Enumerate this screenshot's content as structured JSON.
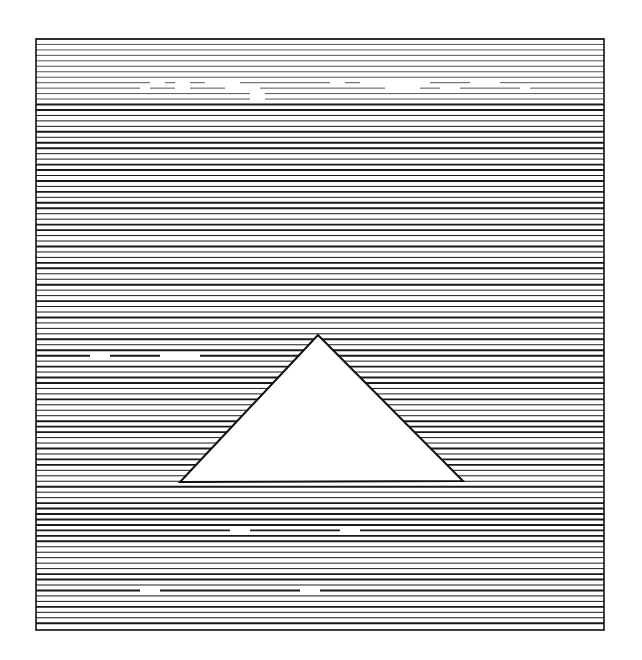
{
  "canvas": {
    "width": 642,
    "height": 660,
    "background": "#ffffff"
  },
  "figure": {
    "type": "horizontal-line-field-with-triangle",
    "frame": {
      "x": 36,
      "y": 39,
      "width": 568,
      "height": 591,
      "stroke": "#111111",
      "stroke_width": 1.6
    },
    "lines": {
      "count": 108,
      "spacing": 5.46,
      "color": "#1a1a1a",
      "thin_width": 1.0,
      "thick_width": 1.9,
      "light_band_end_index": 12,
      "light_color": "#555555"
    },
    "triangle": {
      "points": [
        [
          318,
          335
        ],
        [
          180,
          482
        ],
        [
          463,
          481
        ]
      ],
      "fill": "#ffffff",
      "stroke": "#111111",
      "stroke_width": 2
    },
    "broken_lines": [
      {
        "index": 8,
        "segments": [
          [
            36,
            150
          ],
          [
            165,
            175
          ],
          [
            190,
            205
          ],
          [
            240,
            330
          ],
          [
            345,
            360
          ],
          [
            430,
            470
          ],
          [
            500,
            604
          ]
        ]
      },
      {
        "index": 9,
        "segments": [
          [
            36,
            140
          ],
          [
            150,
            175
          ],
          [
            190,
            225
          ],
          [
            260,
            385
          ],
          [
            420,
            440
          ],
          [
            460,
            520
          ],
          [
            530,
            604
          ]
        ]
      },
      {
        "index": 10,
        "segments": [
          [
            36,
            250
          ],
          [
            265,
            604
          ]
        ]
      },
      {
        "index": 11,
        "segments": [
          [
            36,
            250
          ],
          [
            265,
            604
          ]
        ]
      },
      {
        "index": 58,
        "segments": [
          [
            36,
            90
          ],
          [
            110,
            160
          ],
          [
            200,
            604
          ]
        ]
      },
      {
        "index": 90,
        "segments": [
          [
            36,
            230
          ],
          [
            250,
            340
          ],
          [
            360,
            604
          ]
        ]
      },
      {
        "index": 101,
        "segments": [
          [
            36,
            140
          ],
          [
            160,
            300
          ],
          [
            320,
            604
          ]
        ]
      }
    ]
  }
}
